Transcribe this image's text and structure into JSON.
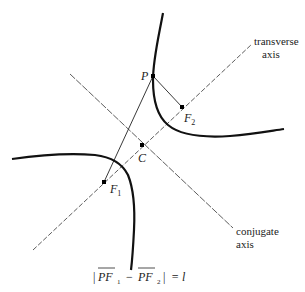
{
  "diagram": {
    "type": "hyperbola",
    "labels": {
      "P": "P",
      "F1_main": "F",
      "F1_sub": "1",
      "F2_main": "F",
      "F2_sub": "2",
      "C": "C",
      "transverse_line1": "transverse",
      "transverse_line2": "axis",
      "conjugate_line1": "conjugate",
      "conjugate_line2": "axis"
    },
    "formula": {
      "bar_left": "|",
      "pf1": "PF",
      "sub1": "1",
      "minus": "−",
      "pf2": "PF",
      "sub2": "2",
      "bar_right": "|",
      "equals": "= l"
    },
    "points": {
      "P": [
        153,
        76
      ],
      "F1": [
        104,
        182
      ],
      "F2": [
        182,
        107
      ],
      "C": [
        142,
        145
      ]
    },
    "colors": {
      "curve": "#111111",
      "axis": "#333333"
    }
  }
}
